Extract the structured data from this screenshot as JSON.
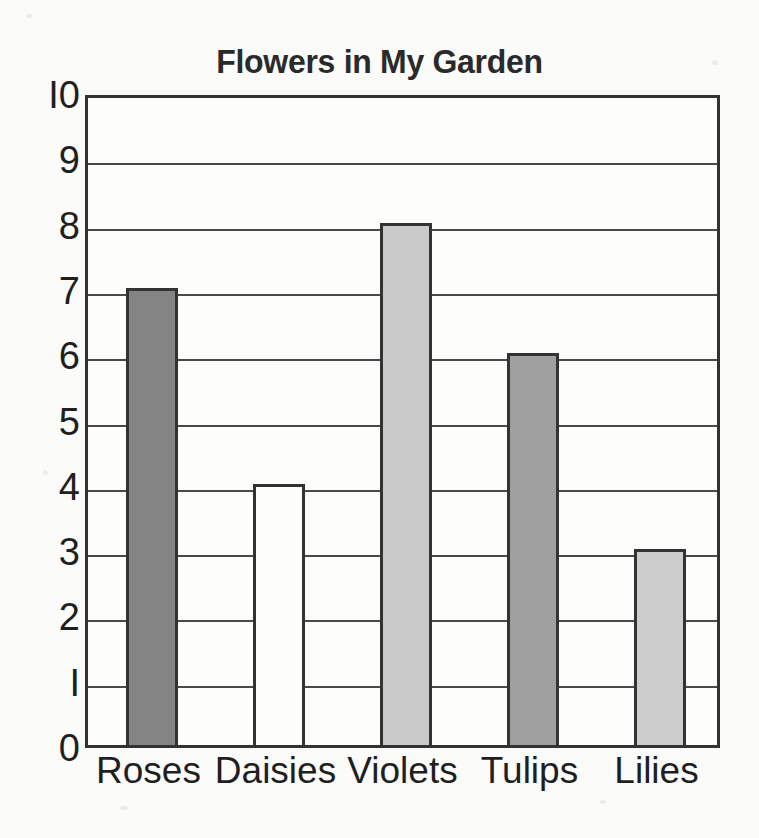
{
  "chart_data": {
    "type": "bar",
    "title": "Flowers in My Garden",
    "xlabel": "",
    "ylabel": "",
    "categories": [
      "Roses",
      "Daisies",
      "Violets",
      "Tulips",
      "Lilies"
    ],
    "values": [
      7,
      4,
      8,
      6,
      3
    ],
    "bar_colors": [
      "#848484",
      "#fdfdfc",
      "#c9c9c9",
      "#a0a0a0",
      "#cdcdcd"
    ],
    "bar_outline_color": "#333333",
    "ylim": [
      0,
      10
    ],
    "yticks": [
      0,
      1,
      2,
      3,
      4,
      5,
      6,
      7,
      8,
      9,
      10
    ],
    "ytick_labels": [
      "0",
      "I",
      "2",
      "3",
      "4",
      "5",
      "6",
      "7",
      "8",
      "9",
      "I0"
    ],
    "grid": true,
    "grid_axis": "y",
    "legend": false,
    "legend_position": "none",
    "background_color": "#fbfbfa",
    "axis_color": "#333333"
  }
}
